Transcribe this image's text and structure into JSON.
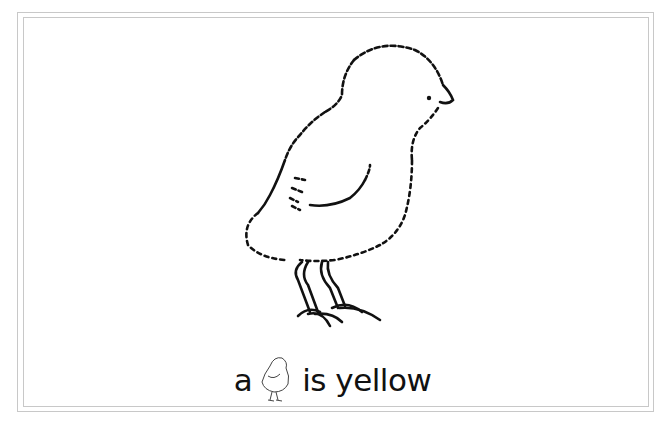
{
  "illustration": {
    "subject": "chick",
    "style": "line-art coloring page"
  },
  "caption": {
    "before": "a",
    "icon": "chick-icon",
    "after": "is yellow"
  },
  "colors": {
    "ink": "#111111",
    "frame": "#c8c8c8",
    "background": "#ffffff"
  }
}
